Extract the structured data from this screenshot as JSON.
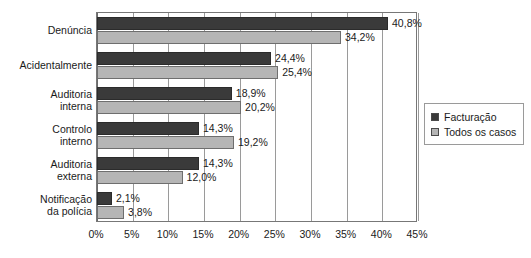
{
  "chart_data": {
    "type": "bar",
    "orientation": "horizontal",
    "title": "",
    "subtitle": "",
    "xlabel": "",
    "ylabel": "",
    "xlim": [
      0,
      45
    ],
    "xtick_labels": [
      "0%",
      "5%",
      "10%",
      "15%",
      "20%",
      "25%",
      "30%",
      "35%",
      "40%",
      "45%"
    ],
    "xticks": [
      0,
      5,
      10,
      15,
      20,
      25,
      30,
      35,
      40,
      45
    ],
    "grid": true,
    "grid_axis": "x",
    "legend_position": "right",
    "value_format": "decimal-comma-percent",
    "categories": [
      "Denúncia",
      "Acidentalmente",
      "Auditoria\ninterna",
      "Controlo\ninterno",
      "Auditoria\nexterna",
      "Notificação\nda polícia"
    ],
    "series": [
      {
        "name": "Facturação",
        "color": "#3a3a3a",
        "values": [
          40.8,
          24.4,
          18.9,
          14.3,
          14.3,
          2.1
        ],
        "labels": [
          "40,8%",
          "24,4%",
          "18,9%",
          "14,3%",
          "14,3%",
          "2,1%"
        ]
      },
      {
        "name": "Todos os casos",
        "color": "#b5b5b5",
        "values": [
          34.2,
          25.4,
          20.2,
          19.2,
          12.0,
          3.8
        ],
        "labels": [
          "34,2%",
          "25,4%",
          "20,2%",
          "19,2%",
          "12,0%",
          "3,8%"
        ]
      }
    ]
  }
}
